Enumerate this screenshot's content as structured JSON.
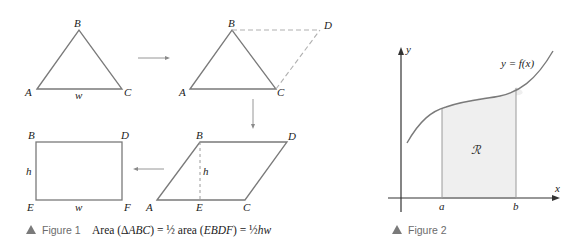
{
  "figure1": {
    "triangle": {
      "labels": {
        "A": "A",
        "B": "B",
        "C": "C",
        "w": "w"
      }
    },
    "parallelogram_construct": {
      "labels": {
        "A": "A",
        "B": "B",
        "C": "C",
        "D": "D"
      }
    },
    "parallelogram": {
      "labels": {
        "A": "A",
        "B": "B",
        "C": "C",
        "D": "D",
        "E": "E",
        "h": "h"
      }
    },
    "rectangle": {
      "labels": {
        "B": "B",
        "D": "D",
        "E": "E",
        "F": "F",
        "h": "h",
        "w": "w"
      }
    },
    "caption": {
      "tag": "Figure 1",
      "text_prefix": "Area (",
      "delta": "Δ",
      "abc": "ABC",
      "mid1": ") = ",
      "half": "½",
      "mid2": " area (",
      "ebdf": "EBDF",
      "mid3": ") = ",
      "hw": "hw"
    }
  },
  "figure2": {
    "axis_labels": {
      "x": "x",
      "y": "y"
    },
    "curve_label": "y = f(x)",
    "region_label": "ℛ",
    "tick_labels": {
      "a": "a",
      "b": "b"
    },
    "caption": {
      "tag": "Figure 2"
    }
  },
  "colors": {
    "stroke": "#7a7a7a",
    "dashed": "#b0b0b0",
    "region_fill": "#efefef",
    "caption_triangle": "#7a7a7a"
  }
}
